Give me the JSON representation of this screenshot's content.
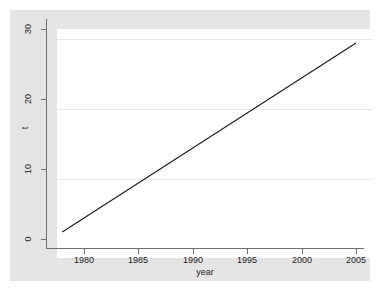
{
  "chart_data": {
    "type": "line",
    "title": "",
    "xlabel": "year",
    "ylabel": "t",
    "xlim": [
      1977.2,
      2005.5
    ],
    "ylim": [
      -0.4,
      30.8
    ],
    "grid": true,
    "gridlines_y": [
      10,
      20,
      30
    ],
    "legend": null,
    "x_ticks": [
      1980,
      1985,
      1990,
      1995,
      2000,
      2005
    ],
    "x_tick_labels": [
      "1980",
      "1985",
      "1990",
      "1995",
      "2000",
      "2005"
    ],
    "y_ticks": [
      0,
      10,
      20,
      30
    ],
    "y_tick_labels": [
      "0",
      "10",
      "20",
      "30"
    ],
    "series": [
      {
        "name": "t",
        "color": "#1a1a1a",
        "x": [
          1978,
          1979,
          1980,
          1981,
          1982,
          1983,
          1984,
          1985,
          1986,
          1987,
          1988,
          1989,
          1990,
          1991,
          1992,
          1993,
          1994,
          1995,
          1996,
          1997,
          1998,
          1999,
          2000,
          2001,
          2002,
          2003,
          2004,
          2005
        ],
        "values": [
          1,
          2,
          3,
          4,
          5,
          6,
          7,
          8,
          9,
          10,
          11,
          12,
          13,
          14,
          15,
          16,
          17,
          18,
          19,
          20,
          21,
          22,
          23,
          24,
          25,
          26,
          27,
          28
        ]
      }
    ]
  },
  "axes": {
    "y_title": "t",
    "x_title": "year",
    "y_labels": [
      "30",
      "20",
      "10",
      "0"
    ],
    "x_labels": [
      "1980",
      "1985",
      "1990",
      "1995",
      "2000",
      "2005"
    ]
  },
  "colors": {
    "figure_background": "#e4e4e4",
    "plot_background": "#ffffff",
    "axis": "#6f6f6f",
    "gridline": "#e8e8e8",
    "series_line": "#1a1a1a",
    "text": "#1a1a1a"
  }
}
